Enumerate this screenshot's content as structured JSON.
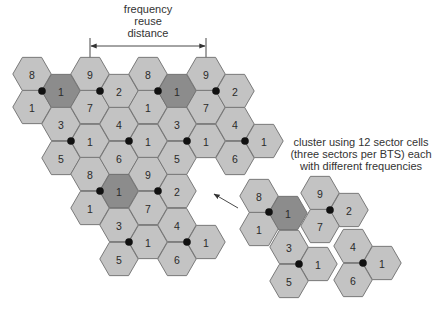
{
  "reuse_label": {
    "lines": [
      "frequency",
      "reuse",
      "distance"
    ],
    "x": 148,
    "y": [
      13,
      25,
      37
    ]
  },
  "dimension": {
    "x1": 90,
    "x2": 206,
    "tick_top": 38,
    "tick_bottom": 58,
    "y": 46
  },
  "cluster_caption": {
    "lines": [
      "cluster using 12 sector cells",
      "(three sectors per BTS) each",
      "with different frequencies"
    ],
    "x": 361,
    "y": [
      146,
      158,
      170
    ]
  },
  "arrow": {
    "x1": 238,
    "y1": 208,
    "x2": 213,
    "y2": 194
  },
  "colors": {
    "cell": "#c3c3c3",
    "highlight_cell": "#8c8c8c",
    "outline": "#6e6e6e",
    "bts": "#111111"
  },
  "hex_radius": 19.3,
  "reuse_pattern": {
    "cells": [
      {
        "x": 32,
        "y": 74,
        "label": "8"
      },
      {
        "x": 32,
        "y": 107,
        "label": "1"
      },
      {
        "x": 61,
        "y": 91,
        "label": "1",
        "dark": true
      },
      {
        "x": 61,
        "y": 124,
        "label": "3"
      },
      {
        "x": 61,
        "y": 158,
        "label": "5"
      },
      {
        "x": 90,
        "y": 74,
        "label": "9"
      },
      {
        "x": 90,
        "y": 107,
        "label": "7"
      },
      {
        "x": 90,
        "y": 141,
        "label": "1"
      },
      {
        "x": 90,
        "y": 174,
        "label": "8"
      },
      {
        "x": 90,
        "y": 208,
        "label": "1"
      },
      {
        "x": 119,
        "y": 91,
        "label": "2"
      },
      {
        "x": 119,
        "y": 124,
        "label": "4"
      },
      {
        "x": 119,
        "y": 158,
        "label": "6"
      },
      {
        "x": 119,
        "y": 191,
        "label": "1",
        "dark": true
      },
      {
        "x": 119,
        "y": 225,
        "label": "3"
      },
      {
        "x": 119,
        "y": 259,
        "label": "5"
      },
      {
        "x": 148,
        "y": 74,
        "label": "8"
      },
      {
        "x": 148,
        "y": 107,
        "label": "1"
      },
      {
        "x": 148,
        "y": 141,
        "label": "1"
      },
      {
        "x": 148,
        "y": 174,
        "label": "9"
      },
      {
        "x": 148,
        "y": 208,
        "label": "7"
      },
      {
        "x": 148,
        "y": 242,
        "label": "1"
      },
      {
        "x": 177,
        "y": 91,
        "label": "1",
        "dark": true
      },
      {
        "x": 177,
        "y": 124,
        "label": "3"
      },
      {
        "x": 177,
        "y": 158,
        "label": "5"
      },
      {
        "x": 177,
        "y": 191,
        "label": "2"
      },
      {
        "x": 177,
        "y": 225,
        "label": "4"
      },
      {
        "x": 177,
        "y": 259,
        "label": "6"
      },
      {
        "x": 206,
        "y": 74,
        "label": "9"
      },
      {
        "x": 206,
        "y": 107,
        "label": "7"
      },
      {
        "x": 206,
        "y": 141,
        "label": "1"
      },
      {
        "x": 206,
        "y": 242,
        "label": "1"
      },
      {
        "x": 235,
        "y": 91,
        "label": "2"
      },
      {
        "x": 235,
        "y": 124,
        "label": "4"
      },
      {
        "x": 235,
        "y": 158,
        "label": "6"
      },
      {
        "x": 264,
        "y": 141,
        "label": "1"
      }
    ],
    "bts": [
      {
        "x": 42,
        "y": 91
      },
      {
        "x": 100,
        "y": 91
      },
      {
        "x": 158,
        "y": 91
      },
      {
        "x": 216,
        "y": 91
      },
      {
        "x": 71,
        "y": 141
      },
      {
        "x": 129,
        "y": 141
      },
      {
        "x": 187,
        "y": 141
      },
      {
        "x": 245,
        "y": 141
      },
      {
        "x": 100,
        "y": 191
      },
      {
        "x": 158,
        "y": 191
      },
      {
        "x": 129,
        "y": 242
      },
      {
        "x": 187,
        "y": 242
      }
    ]
  },
  "cluster": {
    "cells": [
      {
        "x": 259,
        "y": 196,
        "label": "8"
      },
      {
        "x": 288,
        "y": 213,
        "label": "1",
        "dark": true
      },
      {
        "x": 259,
        "y": 229,
        "label": "1"
      },
      {
        "x": 320,
        "y": 193,
        "label": "9"
      },
      {
        "x": 349,
        "y": 210,
        "label": "2"
      },
      {
        "x": 320,
        "y": 226,
        "label": "7"
      },
      {
        "x": 289,
        "y": 247,
        "label": "3"
      },
      {
        "x": 318,
        "y": 264,
        "label": "1"
      },
      {
        "x": 289,
        "y": 281,
        "label": "5"
      },
      {
        "x": 353,
        "y": 246,
        "label": "4"
      },
      {
        "x": 382,
        "y": 263,
        "label": "1"
      },
      {
        "x": 353,
        "y": 280,
        "label": "6"
      }
    ],
    "bts": [
      {
        "x": 269,
        "y": 212
      },
      {
        "x": 330,
        "y": 210
      },
      {
        "x": 299,
        "y": 264
      },
      {
        "x": 363,
        "y": 263
      }
    ]
  }
}
